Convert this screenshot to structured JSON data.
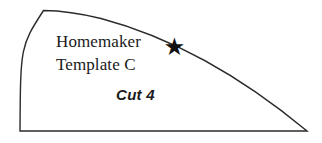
{
  "canvas": {
    "width": 322,
    "height": 143,
    "background_color": "#ffffff"
  },
  "pattern_piece": {
    "outline_color": "#2b2b2b",
    "fill_color": "#ffffff",
    "stroke_width": 1.4,
    "shape_description": "quarter-ellipse pattern template wedge"
  },
  "labels": {
    "title_line1": "Homemaker",
    "title_line2": "Template C",
    "cut_instruction": "Cut 4",
    "marker_glyph": "★",
    "marker_name": "asterisk-marker"
  }
}
